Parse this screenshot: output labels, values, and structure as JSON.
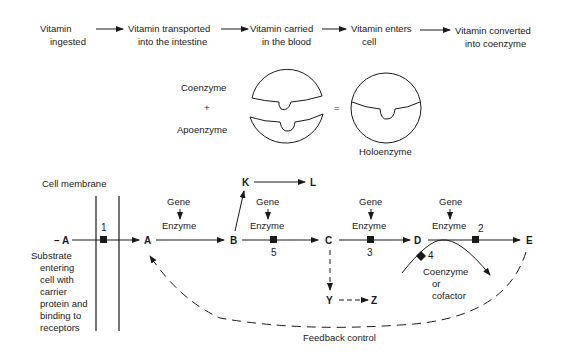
{
  "pathway": {
    "steps": [
      {
        "line1": "Vitamin",
        "line2": "ingested"
      },
      {
        "line1": "Vitamin transported",
        "line2": "into the intestine"
      },
      {
        "line1": "Vitamin carried",
        "line2": "in the blood"
      },
      {
        "line1": "Vitamin enters",
        "line2": "cell"
      },
      {
        "line1": "Vitamin converted",
        "line2": "into coenzyme"
      }
    ]
  },
  "enzyme_equation": {
    "coenzyme": "Coenzyme",
    "plus": "+",
    "apoenzyme": "Apoenzyme",
    "equals": "=",
    "holoenzyme": "Holoenzyme"
  },
  "metabolic_diagram": {
    "cell_membrane_label": "Cell membrane",
    "substrate_note": [
      "Substrate",
      "entering",
      "cell with",
      "carrier",
      "protein and",
      "binding to",
      "receptors"
    ],
    "nodes": {
      "a_outside": "– A",
      "a_inside": "A",
      "b": "B",
      "c": "C",
      "d": "D",
      "e": "E",
      "k": "K",
      "l": "L",
      "y": "Y",
      "z": "Z"
    },
    "gene_label": "Gene",
    "enzyme_label": "Enzyme",
    "block_numbers": {
      "one": "1",
      "two": "2",
      "three": "3",
      "four": "4",
      "five": "5"
    },
    "cofactor_label": [
      "Coenzyme",
      "or",
      "cofactor"
    ],
    "feedback_label": "Feedback control"
  }
}
